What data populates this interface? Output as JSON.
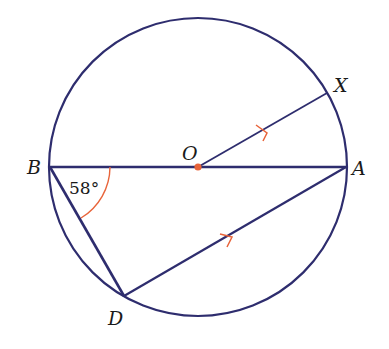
{
  "diagram": {
    "colors": {
      "line": "#2e2d6e",
      "accent": "#e8643a",
      "text": "#1a1a1a",
      "background": "#ffffff"
    },
    "circle": {
      "center_label": "O",
      "cx": 198,
      "cy": 167,
      "r": 149
    },
    "points": {
      "A": {
        "label": "A",
        "x": 346,
        "y": 167
      },
      "B": {
        "label": "B",
        "x": 50,
        "y": 167
      },
      "O": {
        "label": "O",
        "x": 198,
        "y": 167
      },
      "X": {
        "label": "X",
        "x": 327,
        "y": 93
      },
      "D": {
        "label": "D",
        "x": 124,
        "y": 296
      }
    },
    "segments": [
      "BA",
      "OX",
      "BD",
      "DA"
    ],
    "parallel_marks": [
      "OX",
      "DA"
    ],
    "angle": {
      "vertex": "B",
      "between": [
        "BA",
        "BD"
      ],
      "label": "58°"
    }
  }
}
